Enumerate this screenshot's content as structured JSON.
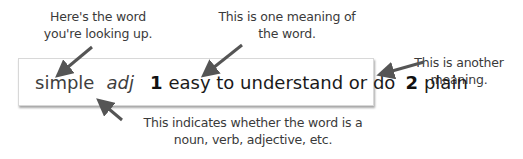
{
  "entry": {
    "headword": "simple",
    "part_of_speech": "adj",
    "senses": [
      {
        "number": "1",
        "text": "easy to understand or do"
      },
      {
        "number": "2",
        "text": "plain"
      }
    ]
  },
  "annotations": {
    "word": "Here's the word you're looking up.",
    "meaning_one": "This is one meaning of the word.",
    "meaning_two": "This is another meaning.",
    "part_of_speech": "This indicates whether the word is a noun, verb, adjective, etc."
  },
  "colors": {
    "arrow": "#555555",
    "note_text": "#3a3a3a"
  }
}
